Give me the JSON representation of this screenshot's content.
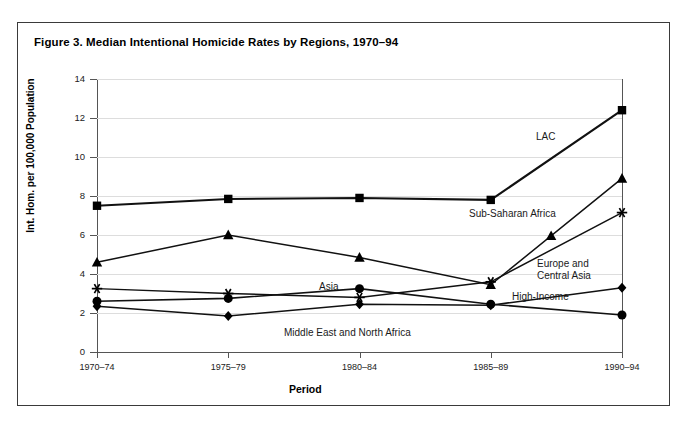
{
  "figure": {
    "title": "Figure 3. Median Intentional Homicide Rates by Regions, 1970–94"
  },
  "chart_data": {
    "type": "line",
    "title": "Figure 3. Median Intentional Homicide Rates by Regions, 1970–94",
    "xlabel": "Period",
    "ylabel": "Int. Hom. per 100,000 Population",
    "categories": [
      "1970–74",
      "1975–79",
      "1980–84",
      "1985–89",
      "1990–94"
    ],
    "ylim": [
      0,
      14
    ],
    "ytick_step": 2,
    "yticks": [
      0,
      2,
      4,
      6,
      8,
      10,
      12,
      14
    ],
    "grid": true,
    "legend": "inline-annotations",
    "series": [
      {
        "name": "LAC",
        "marker": "square",
        "values": [
          7.5,
          7.85,
          7.9,
          7.8,
          12.4
        ]
      },
      {
        "name": "Sub-Saharan Africa",
        "marker": "triangle",
        "values": [
          4.6,
          6.0,
          4.85,
          3.45,
          8.9
        ]
      },
      {
        "name": "Europe and Central Asia",
        "marker": "asterisk",
        "values": [
          3.25,
          3.0,
          2.8,
          3.6,
          7.15
        ]
      },
      {
        "name": "Asia",
        "marker": "circle",
        "values": [
          2.6,
          2.75,
          3.25,
          2.45,
          1.9
        ]
      },
      {
        "name": "High-Income",
        "marker": "diamond",
        "values": [
          2.35,
          1.85,
          2.45,
          2.4,
          3.3
        ]
      }
    ]
  },
  "annotations": [
    {
      "text": "LAC",
      "x": 536,
      "y": 131
    },
    {
      "text": "Sub-Saharan Africa",
      "x": 469,
      "y": 208
    },
    {
      "text": "Europe and\nCentral Asia",
      "x": 537,
      "y": 258
    },
    {
      "text": "High-Income",
      "x": 512,
      "y": 291
    },
    {
      "text": "Asia",
      "x": 319,
      "y": 281
    },
    {
      "text": "Middle East and North Africa",
      "x": 284,
      "y": 327
    }
  ]
}
